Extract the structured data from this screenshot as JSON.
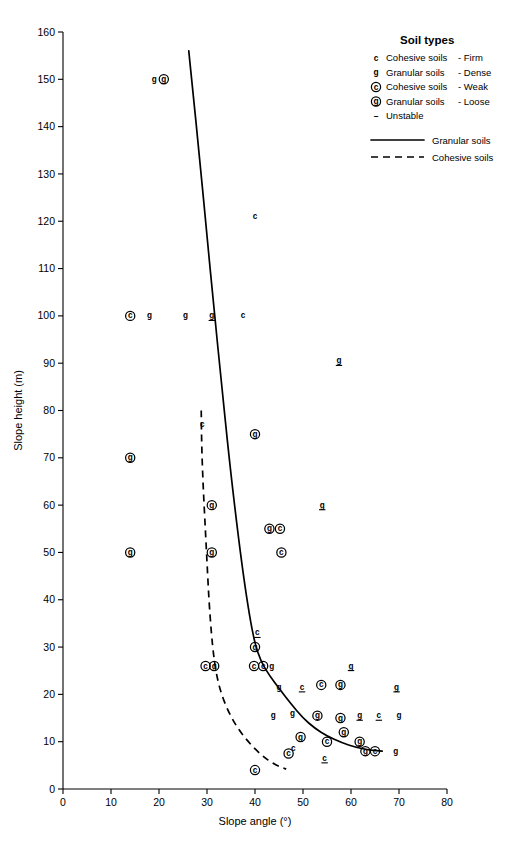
{
  "chart_data": {
    "type": "scatter",
    "title": "",
    "xlabel": "Slope angle (°)",
    "ylabel": "Slope height (m)",
    "xlim": [
      0,
      80
    ],
    "ylim": [
      0,
      160
    ],
    "xticks": [
      0,
      10,
      20,
      30,
      40,
      50,
      60,
      70,
      80
    ],
    "yticks": [
      0,
      10,
      20,
      30,
      40,
      50,
      60,
      70,
      80,
      90,
      100,
      110,
      120,
      130,
      140,
      150,
      160
    ],
    "grid": false,
    "legend_position": "top-right",
    "marker_types": {
      "c": "Cohesive soils - Firm",
      "g": "Granular soils - Dense",
      "C": "Cohesive soils - Weak",
      "G": "Granular soils - Loose",
      "underline": "Unstable"
    },
    "points": [
      {
        "x": 19.0,
        "y": 150,
        "sym": "g",
        "circled": false,
        "unstable": false
      },
      {
        "x": 21.0,
        "y": 150,
        "sym": "G",
        "circled": true,
        "unstable": false
      },
      {
        "x": 40.0,
        "y": 121,
        "sym": "c",
        "circled": false,
        "unstable": false
      },
      {
        "x": 14.0,
        "y": 100,
        "sym": "C",
        "circled": true,
        "unstable": false
      },
      {
        "x": 18.0,
        "y": 100,
        "sym": "g",
        "circled": false,
        "unstable": false
      },
      {
        "x": 25.5,
        "y": 100,
        "sym": "g",
        "circled": false,
        "unstable": false
      },
      {
        "x": 31.0,
        "y": 100,
        "sym": "g",
        "circled": false,
        "unstable": true
      },
      {
        "x": 37.5,
        "y": 100,
        "sym": "c",
        "circled": false,
        "unstable": false
      },
      {
        "x": 57.5,
        "y": 90.5,
        "sym": "g",
        "circled": false,
        "unstable": true
      },
      {
        "x": 29.0,
        "y": 77,
        "sym": "c",
        "circled": false,
        "unstable": false
      },
      {
        "x": 40.0,
        "y": 75,
        "sym": "G",
        "circled": true,
        "unstable": false
      },
      {
        "x": 14.0,
        "y": 70,
        "sym": "G",
        "circled": true,
        "unstable": false
      },
      {
        "x": 31.0,
        "y": 60,
        "sym": "G",
        "circled": true,
        "unstable": false
      },
      {
        "x": 54.0,
        "y": 60,
        "sym": "g",
        "circled": false,
        "unstable": true
      },
      {
        "x": 43.0,
        "y": 55,
        "sym": "G",
        "circled": true,
        "unstable": false
      },
      {
        "x": 45.2,
        "y": 55,
        "sym": "C",
        "circled": true,
        "unstable": false
      },
      {
        "x": 14.0,
        "y": 50,
        "sym": "G",
        "circled": true,
        "unstable": false
      },
      {
        "x": 31.0,
        "y": 50,
        "sym": "G",
        "circled": true,
        "unstable": false
      },
      {
        "x": 45.5,
        "y": 50,
        "sym": "C",
        "circled": true,
        "unstable": false
      },
      {
        "x": 40.5,
        "y": 33,
        "sym": "c",
        "circled": false,
        "unstable": true
      },
      {
        "x": 40.0,
        "y": 30,
        "sym": "G",
        "circled": true,
        "unstable": false
      },
      {
        "x": 29.7,
        "y": 26,
        "sym": "C",
        "circled": true,
        "unstable": false
      },
      {
        "x": 31.5,
        "y": 26,
        "sym": "G",
        "circled": true,
        "unstable": false
      },
      {
        "x": 39.8,
        "y": 26,
        "sym": "C",
        "circled": true,
        "unstable": false
      },
      {
        "x": 41.7,
        "y": 26,
        "sym": "C",
        "circled": true,
        "unstable": false
      },
      {
        "x": 43.5,
        "y": 26,
        "sym": "g",
        "circled": false,
        "unstable": false
      },
      {
        "x": 60.0,
        "y": 26,
        "sym": "g",
        "circled": false,
        "unstable": true
      },
      {
        "x": 45.0,
        "y": 21.5,
        "sym": "g",
        "circled": false,
        "unstable": false
      },
      {
        "x": 49.8,
        "y": 21.5,
        "sym": "c",
        "circled": false,
        "unstable": true
      },
      {
        "x": 53.8,
        "y": 22,
        "sym": "C",
        "circled": true,
        "unstable": false
      },
      {
        "x": 57.8,
        "y": 22,
        "sym": "G",
        "circled": true,
        "unstable": false
      },
      {
        "x": 69.5,
        "y": 21.5,
        "sym": "g",
        "circled": false,
        "unstable": true
      },
      {
        "x": 43.8,
        "y": 15.5,
        "sym": "g",
        "circled": false,
        "unstable": false
      },
      {
        "x": 47.8,
        "y": 16,
        "sym": "g",
        "circled": false,
        "unstable": false
      },
      {
        "x": 53.0,
        "y": 15.5,
        "sym": "G",
        "circled": true,
        "unstable": false
      },
      {
        "x": 57.8,
        "y": 15,
        "sym": "G",
        "circled": true,
        "unstable": false
      },
      {
        "x": 61.8,
        "y": 15.5,
        "sym": "g",
        "circled": false,
        "unstable": true
      },
      {
        "x": 65.8,
        "y": 15.5,
        "sym": "c",
        "circled": false,
        "unstable": true
      },
      {
        "x": 70.0,
        "y": 15.5,
        "sym": "g",
        "circled": false,
        "unstable": false
      },
      {
        "x": 58.5,
        "y": 12,
        "sym": "G",
        "circled": true,
        "unstable": false
      },
      {
        "x": 49.5,
        "y": 11,
        "sym": "G",
        "circled": true,
        "unstable": false
      },
      {
        "x": 55.0,
        "y": 10,
        "sym": "C",
        "circled": true,
        "unstable": false
      },
      {
        "x": 61.8,
        "y": 10,
        "sym": "G",
        "circled": true,
        "unstable": false
      },
      {
        "x": 47.0,
        "y": 7.5,
        "sym": "C",
        "circled": true,
        "unstable": false
      },
      {
        "x": 48.0,
        "y": 8.5,
        "sym": "c",
        "circled": false,
        "unstable": false
      },
      {
        "x": 63.0,
        "y": 8,
        "sym": "G",
        "circled": true,
        "unstable": false
      },
      {
        "x": 65.0,
        "y": 8,
        "sym": "C",
        "circled": true,
        "unstable": false
      },
      {
        "x": 69.3,
        "y": 8,
        "sym": "g",
        "circled": false,
        "unstable": false
      },
      {
        "x": 54.5,
        "y": 6.5,
        "sym": "c",
        "circled": false,
        "unstable": true
      },
      {
        "x": 40.0,
        "y": 4,
        "sym": "C",
        "circled": true,
        "unstable": false
      }
    ],
    "curves": [
      {
        "name": "Granular soils",
        "style": "solid",
        "points": [
          [
            26.2,
            156
          ],
          [
            27.0,
            148
          ],
          [
            28.4,
            134
          ],
          [
            29.9,
            118
          ],
          [
            31.4,
            102
          ],
          [
            33.0,
            86
          ],
          [
            34.6,
            70
          ],
          [
            36.2,
            56
          ],
          [
            37.6,
            45
          ],
          [
            38.8,
            37
          ],
          [
            39.9,
            31
          ],
          [
            41.2,
            27
          ],
          [
            43.0,
            24
          ],
          [
            45.2,
            21
          ],
          [
            47.5,
            18
          ],
          [
            50.0,
            15
          ],
          [
            52.5,
            12.8
          ],
          [
            55.0,
            11.2
          ],
          [
            58.0,
            9.8
          ],
          [
            61.0,
            8.8
          ],
          [
            64.0,
            8.2
          ],
          [
            66.5,
            8.0
          ]
        ]
      },
      {
        "name": "Cohesive soils",
        "style": "dashed",
        "points": [
          [
            28.8,
            80
          ],
          [
            28.9,
            72
          ],
          [
            29.2,
            64
          ],
          [
            29.6,
            56
          ],
          [
            30.0,
            48
          ],
          [
            30.4,
            40
          ],
          [
            30.9,
            33
          ],
          [
            31.4,
            28
          ],
          [
            32.0,
            24
          ],
          [
            33.0,
            20
          ],
          [
            34.6,
            16
          ],
          [
            36.6,
            12.5
          ],
          [
            39.0,
            9.5
          ],
          [
            41.5,
            7.0
          ],
          [
            44.0,
            5.2
          ],
          [
            46.5,
            4.2
          ]
        ]
      }
    ]
  },
  "legend": {
    "title": "Soil types",
    "entries": [
      {
        "sym": "c",
        "circled": false,
        "label": "Cohesive soils",
        "qualifier": "- Firm"
      },
      {
        "sym": "g",
        "circled": false,
        "label": "Granular soils",
        "qualifier": "- Dense"
      },
      {
        "sym": "C",
        "circled": true,
        "label": "Cohesive soils",
        "qualifier": "- Weak"
      },
      {
        "sym": "G",
        "circled": true,
        "label": "Granular soils",
        "qualifier": "- Loose"
      },
      {
        "sym": "-",
        "circled": false,
        "label": "Unstable",
        "qualifier": ""
      }
    ],
    "lines": [
      {
        "style": "solid",
        "label": "Granular soils"
      },
      {
        "style": "dashed",
        "label": "Cohesive soils"
      }
    ]
  }
}
